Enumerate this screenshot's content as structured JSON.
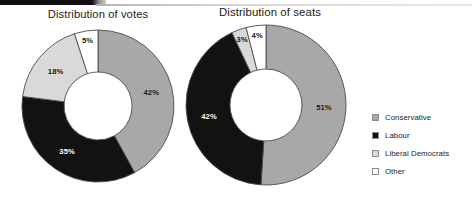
{
  "page": {
    "background": "#ffffff",
    "width": 472,
    "height": 219
  },
  "decor": {
    "top_rule_dark_color": "#120d10",
    "top_rule_light_color": "#cfcfcf"
  },
  "charts": {
    "votes": {
      "title": "Distribution of votes",
      "labels": [
        "42%",
        "35%",
        "18%",
        "5%"
      ]
    },
    "seats": {
      "title": "Distribution of seats",
      "labels": [
        "51%",
        "42%",
        "3%",
        "4%"
      ]
    }
  },
  "legend": {
    "items": [
      {
        "label": "Conservative",
        "color": "#a8a8a8",
        "border": "#8d8d8d"
      },
      {
        "label": "Labour",
        "color": "#121212",
        "border": "#8d8d8d"
      },
      {
        "label": "Liberal Democrats",
        "color": "#d9d9d9",
        "border": "#8d8d8d"
      },
      {
        "label": "Other",
        "color": "#ffffff",
        "border": "#8d8d8d"
      }
    ]
  },
  "chart_data": [
    {
      "type": "pie",
      "title": "Distribution of votes",
      "subtitle": "",
      "donut": true,
      "inner_radius_ratio": 0.45,
      "start_angle_deg": 0,
      "direction": "clockwise",
      "categories": [
        "Conservative",
        "Labour",
        "Liberal Democrats",
        "Other"
      ],
      "values": [
        42,
        35,
        18,
        5
      ],
      "value_labels": [
        "42%",
        "35%",
        "18%",
        "5%"
      ],
      "colors": [
        "#a8a8a8",
        "#121212",
        "#d9d9d9",
        "#ffffff"
      ],
      "units": "percent",
      "legend_position": "right",
      "grid": false,
      "xlabel": "",
      "ylabel": ""
    },
    {
      "type": "pie",
      "title": "Distribution of seats",
      "subtitle": "",
      "donut": true,
      "inner_radius_ratio": 0.45,
      "start_angle_deg": 0,
      "direction": "clockwise",
      "categories": [
        "Conservative",
        "Labour",
        "Liberal Democrats",
        "Other"
      ],
      "values": [
        51,
        42,
        3,
        4
      ],
      "value_labels": [
        "51%",
        "42%",
        "3%",
        "4%"
      ],
      "colors": [
        "#a8a8a8",
        "#121212",
        "#d9d9d9",
        "#ffffff"
      ],
      "units": "percent",
      "legend_position": "right",
      "grid": false,
      "xlabel": "",
      "ylabel": ""
    }
  ]
}
